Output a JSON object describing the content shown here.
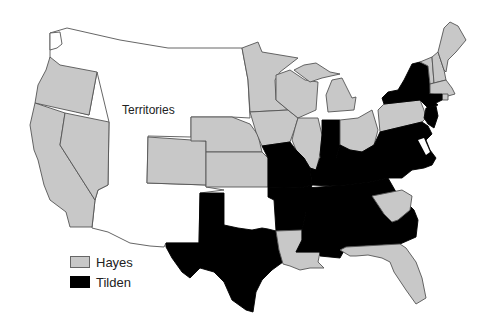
{
  "map": {
    "subject": "1876 United States presidential election results by state",
    "territories_label": "Territories",
    "colors": {
      "hayes": "#c8c8c8",
      "tilden": "#000000",
      "territories": "#ffffff",
      "border": "#555555"
    },
    "legend": [
      {
        "label": "Hayes",
        "color": "#c8c8c8"
      },
      {
        "label": "Tilden",
        "color": "#000000"
      }
    ],
    "states": {
      "hayes": [
        "Oregon",
        "California",
        "Nevada",
        "Colorado",
        "Nebraska",
        "Kansas",
        "Minnesota",
        "Iowa",
        "Wisconsin",
        "Illinois",
        "Michigan",
        "Ohio",
        "Pennsylvania",
        "Vermont",
        "New Hampshire",
        "Maine",
        "Massachusetts",
        "Rhode Island",
        "South Carolina",
        "Louisiana",
        "Florida"
      ],
      "tilden": [
        "Texas",
        "Missouri",
        "Arkansas",
        "Indiana",
        "Kentucky",
        "Tennessee",
        "Mississippi",
        "Alabama",
        "Georgia",
        "North Carolina",
        "Virginia",
        "West Virginia",
        "Maryland",
        "Delaware",
        "New Jersey",
        "New York",
        "Connecticut"
      ]
    }
  }
}
